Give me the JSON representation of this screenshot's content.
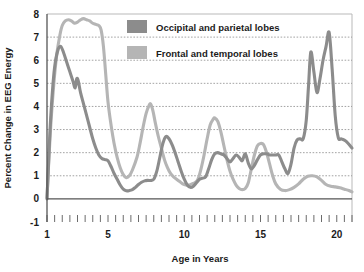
{
  "chart_data": {
    "type": "line",
    "title": "",
    "xlabel": "Age in Years",
    "ylabel": "Percent Change in EEG Energy",
    "xlim": [
      1,
      21
    ],
    "ylim": [
      -1,
      8
    ],
    "grid": true,
    "legend_position": "top-center-inside",
    "x_ticks_major": [
      1,
      5,
      10,
      15,
      20
    ],
    "x_tick_labels": [
      "1",
      "5",
      "10",
      "15",
      "20"
    ],
    "x_minor_tick_step": 0.5,
    "y_ticks": [
      -1,
      0,
      1,
      2,
      3,
      4,
      5,
      6,
      7,
      8
    ],
    "y_tick_labels": [
      "-1",
      "0",
      "1",
      "2",
      "3",
      "4",
      "5",
      "6",
      "7",
      "8"
    ],
    "series": [
      {
        "name": "Occipital and parietal lobes",
        "color": "#8c8c8c",
        "x": [
          1.0,
          1.08,
          1.2,
          1.35,
          1.5,
          1.7,
          1.9,
          2.1,
          2.3,
          2.5,
          2.7,
          2.85,
          2.95,
          3.05,
          3.2,
          3.4,
          3.6,
          3.8,
          4.0,
          4.2,
          4.4,
          4.6,
          4.8,
          5.0,
          5.2,
          5.4,
          5.6,
          5.8,
          6.0,
          6.2,
          6.4,
          6.6,
          6.8,
          7.0,
          7.2,
          7.4,
          7.6,
          7.8,
          8.0,
          8.2,
          8.4,
          8.6,
          8.8,
          9.0,
          9.2,
          9.4,
          9.6,
          9.8,
          10.0,
          10.2,
          10.4,
          10.6,
          10.8,
          11.0,
          11.2,
          11.4,
          11.6,
          11.8,
          12.0,
          12.2,
          12.4,
          12.6,
          12.8,
          13.0,
          13.2,
          13.4,
          13.6,
          13.8,
          14.0,
          14.2,
          14.4,
          14.6,
          14.8,
          15.0,
          15.2,
          15.4,
          15.6,
          15.8,
          16.0,
          16.2,
          16.4,
          16.6,
          16.8,
          17.0,
          17.2,
          17.4,
          17.6,
          17.8,
          18.0,
          18.15,
          18.3,
          18.5,
          18.7,
          18.9,
          19.1,
          19.3,
          19.5,
          19.7,
          19.9,
          20.1,
          20.3,
          20.6,
          21.0
        ],
        "y": [
          0.0,
          1.2,
          3.0,
          4.6,
          5.7,
          6.4,
          6.6,
          6.3,
          5.9,
          5.5,
          5.1,
          4.8,
          5.2,
          5.1,
          4.6,
          4.1,
          3.6,
          3.1,
          2.6,
          2.2,
          1.9,
          1.75,
          1.7,
          1.65,
          1.4,
          1.1,
          0.85,
          0.6,
          0.42,
          0.35,
          0.36,
          0.4,
          0.5,
          0.62,
          0.72,
          0.78,
          0.8,
          0.8,
          0.85,
          1.2,
          1.8,
          2.4,
          2.7,
          2.6,
          2.35,
          2.0,
          1.6,
          1.2,
          0.85,
          0.6,
          0.5,
          0.55,
          0.7,
          0.85,
          0.9,
          0.95,
          1.3,
          1.7,
          1.95,
          2.0,
          1.95,
          1.9,
          1.75,
          1.6,
          1.75,
          1.9,
          1.8,
          1.65,
          1.95,
          1.55,
          1.3,
          1.45,
          1.7,
          1.9,
          1.95,
          1.95,
          1.9,
          1.9,
          1.9,
          1.9,
          1.6,
          1.3,
          1.1,
          1.5,
          2.2,
          2.55,
          2.6,
          2.6,
          3.4,
          4.9,
          6.35,
          5.5,
          4.6,
          5.2,
          6.0,
          6.6,
          7.2,
          5.6,
          3.6,
          2.65,
          2.6,
          2.5,
          2.2
        ]
      },
      {
        "name": "Frontal and temporal lobes",
        "color": "#b5b5b5",
        "x": [
          1.0,
          1.1,
          1.25,
          1.45,
          1.65,
          1.85,
          2.0,
          2.2,
          2.4,
          2.6,
          2.8,
          3.0,
          3.2,
          3.4,
          3.6,
          3.8,
          4.0,
          4.2,
          4.4,
          4.55,
          4.7,
          4.85,
          5.0,
          5.2,
          5.4,
          5.6,
          5.8,
          6.0,
          6.2,
          6.4,
          6.6,
          6.9,
          7.1,
          7.3,
          7.5,
          7.7,
          7.8,
          7.95,
          8.1,
          8.3,
          8.5,
          8.7,
          8.9,
          9.1,
          9.3,
          9.5,
          9.7,
          9.9,
          10.1,
          10.3,
          10.5,
          10.7,
          10.9,
          11.1,
          11.3,
          11.5,
          11.7,
          11.9,
          12.0,
          12.2,
          12.4,
          12.6,
          12.8,
          13.0,
          13.2,
          13.4,
          13.6,
          13.8,
          14.0,
          14.2,
          14.4,
          14.6,
          14.8,
          15.0,
          15.2,
          15.4,
          15.6,
          15.8,
          16.0,
          16.3,
          16.6,
          16.9,
          17.2,
          17.5,
          17.8,
          18.1,
          18.4,
          18.7,
          19.0,
          19.3,
          19.6,
          19.9,
          20.2,
          20.5,
          20.8,
          21.0
        ],
        "y": [
          0.05,
          1.4,
          3.2,
          5.0,
          6.3,
          7.1,
          7.5,
          7.7,
          7.75,
          7.7,
          7.6,
          7.65,
          7.75,
          7.8,
          7.75,
          7.7,
          7.6,
          7.55,
          7.5,
          7.3,
          6.6,
          5.4,
          4.2,
          3.2,
          2.4,
          1.8,
          1.35,
          1.05,
          0.92,
          1.0,
          1.25,
          1.8,
          2.4,
          3.1,
          3.7,
          4.05,
          4.1,
          3.8,
          3.3,
          2.7,
          2.2,
          1.7,
          1.35,
          1.1,
          0.95,
          0.85,
          0.75,
          0.65,
          0.6,
          0.6,
          0.65,
          0.7,
          0.85,
          1.3,
          1.9,
          2.6,
          3.2,
          3.45,
          3.5,
          3.35,
          2.9,
          2.3,
          1.7,
          1.2,
          0.85,
          0.6,
          0.45,
          0.4,
          0.45,
          0.7,
          1.3,
          1.9,
          2.3,
          2.4,
          2.35,
          2.0,
          1.5,
          1.0,
          0.65,
          0.42,
          0.36,
          0.4,
          0.5,
          0.65,
          0.85,
          0.98,
          1.0,
          0.95,
          0.8,
          0.62,
          0.55,
          0.52,
          0.48,
          0.42,
          0.36,
          0.3
        ]
      }
    ]
  },
  "legend": {
    "entries": [
      {
        "label": "Occipital and parietal lobes",
        "color": "#8c8c8c"
      },
      {
        "label": "Frontal and temporal lobes",
        "color": "#b5b5b5"
      }
    ]
  }
}
